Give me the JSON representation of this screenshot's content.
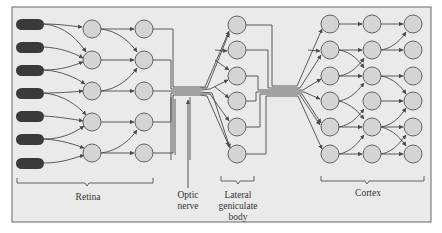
{
  "diagram": {
    "colors": {
      "background": "#eaeaea",
      "frame": "#666666",
      "line": "#4a4a4a",
      "node_fill": "#d4d4d4",
      "node_stroke": "#555555",
      "receptor": "#3a3a3a"
    },
    "labels": {
      "retina": "Retina",
      "optic_nerve_line1": "Optic",
      "optic_nerve_line2": "nerve",
      "lgn_line1": "Lateral",
      "lgn_line2": "geniculate",
      "lgn_line3": "body",
      "cortex": "Cortex"
    },
    "groups": [
      {
        "name": "Retina",
        "layers": [
          "photoreceptors (7)",
          "retina layer 1 (5)",
          "retina layer 2 (5)"
        ]
      },
      {
        "name": "Optic nerve",
        "type": "fiber bundle"
      },
      {
        "name": "Lateral geniculate body",
        "layers": [
          "LGN (6)"
        ]
      },
      {
        "name": "Cortex",
        "layers": [
          "cortex col 1 (6)",
          "cortex col 2 (6)",
          "cortex col 3 (6)"
        ]
      }
    ]
  }
}
